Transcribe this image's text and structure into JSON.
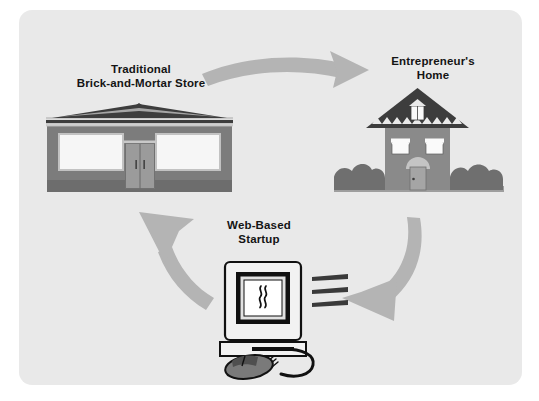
{
  "figure": {
    "panel_background": "#e9e9e9",
    "page_background": "#ffffff",
    "text_color": "#141414"
  },
  "nodes": [
    {
      "id": "store",
      "icon": "brick-and-mortar-store-icon",
      "label_line1": "Traditional",
      "label_line2": "Brick-and-Mortar Store",
      "colors": {
        "roof": "#3d3d3d",
        "facade": "#7c7c7c",
        "window": "#f4f4f4",
        "door": "#9b9b9b",
        "base": "#6d6d6d",
        "trim": "#c9c9c9"
      }
    },
    {
      "id": "home",
      "icon": "entrepreneurs-home-icon",
      "label_line1": "Entrepreneur's",
      "label_line2": "Home",
      "colors": {
        "roof": "#3d3d3d",
        "wall": "#8a8a8a",
        "window": "#fafafa",
        "door": "#a5a5a5",
        "bush": "#6f6f6f",
        "ground": "#9e9e9e"
      }
    },
    {
      "id": "startup",
      "icon": "web-based-startup-computer-icon",
      "label_line1": "Web-Based",
      "label_line2": "Startup",
      "colors": {
        "case": "#f2f2f2",
        "bezel": "#111111",
        "screen": "#ffffff",
        "mouse": "#7a7a7a",
        "outline": "#111111",
        "speed_lines": "#3a3a3a"
      }
    }
  ],
  "arrows": [
    {
      "id": "store-to-home",
      "from": "store",
      "to": "home",
      "direction": "clockwise-top",
      "color": "#b4b4b4"
    },
    {
      "id": "home-to-startup",
      "from": "home",
      "to": "startup",
      "direction": "clockwise-right",
      "color": "#b4b4b4"
    },
    {
      "id": "startup-to-store",
      "from": "startup",
      "to": "store",
      "direction": "clockwise-left",
      "color": "#b4b4b4"
    }
  ]
}
